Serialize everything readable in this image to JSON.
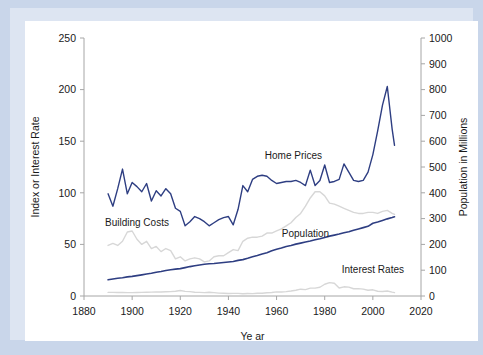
{
  "figure": {
    "background_color": "#c9d6ea",
    "panel_color": "#ffffff",
    "border_color": "#dde5f2"
  },
  "chart_data": {
    "type": "line",
    "title": "",
    "subtitle": "",
    "xlabel": "Ye ar",
    "ylabel": "Index or Interest Rate",
    "y2label": "Population in Millions",
    "xlim": [
      1880,
      2020
    ],
    "ylim": [
      0,
      250
    ],
    "y2lim": [
      0,
      1000
    ],
    "grid": false,
    "legend_position": "inline-annotations",
    "xticks": [
      1880,
      1900,
      1920,
      1940,
      1960,
      1980,
      2000,
      2020
    ],
    "xtick_labels": [
      "1880",
      "1900",
      "1920",
      "1940",
      "1960",
      "1980",
      "2000",
      "2020"
    ],
    "yticks": [
      0,
      50,
      100,
      150,
      200,
      250
    ],
    "ytick_labels": [
      "0",
      "50",
      "100",
      "150",
      "200",
      "250"
    ],
    "y2ticks": [
      0,
      100,
      200,
      300,
      400,
      500,
      600,
      700,
      800,
      900,
      1000
    ],
    "y2tick_labels": [
      "0",
      "100",
      "200",
      "300",
      "400",
      "500",
      "600",
      "700",
      "800",
      "900",
      "1000"
    ],
    "annotations": [
      {
        "text": "Home Prices",
        "x": 1967,
        "y": 133,
        "color": "#2e3e82"
      },
      {
        "text": "Building Costs",
        "x": 1902,
        "y": 68,
        "color": "#1a1a1a"
      },
      {
        "text": "Population",
        "x": 1972,
        "y": 57,
        "color": "#1a1a1a"
      },
      {
        "text": "Interest Rates",
        "x": 2000,
        "y": 22,
        "color": "#1a1a1a"
      }
    ],
    "x": [
      1890,
      1892,
      1894,
      1896,
      1898,
      1900,
      1902,
      1904,
      1906,
      1908,
      1910,
      1912,
      1914,
      1916,
      1918,
      1920,
      1922,
      1924,
      1926,
      1928,
      1930,
      1932,
      1934,
      1936,
      1938,
      1940,
      1942,
      1944,
      1946,
      1948,
      1950,
      1952,
      1954,
      1956,
      1958,
      1960,
      1962,
      1964,
      1966,
      1968,
      1970,
      1972,
      1974,
      1976,
      1978,
      1980,
      1982,
      1984,
      1986,
      1988,
      1990,
      1992,
      1994,
      1996,
      1998,
      2000,
      2002,
      2004,
      2006,
      2008,
      2009
    ],
    "series": [
      {
        "name": "Home Prices",
        "axis": "left",
        "color": "#2e3e82",
        "width": 1.4,
        "values": [
          99,
          87,
          104,
          123,
          99,
          110,
          106,
          101,
          109,
          92,
          102,
          97,
          104,
          99,
          85,
          82,
          68,
          72,
          77,
          75,
          72,
          68,
          71,
          74,
          76,
          77,
          69,
          84,
          107,
          101,
          113,
          116,
          117,
          116,
          112,
          109,
          110,
          111,
          111,
          112,
          110,
          107,
          122,
          107,
          112,
          127,
          110,
          111,
          113,
          128,
          120,
          112,
          111,
          112,
          120,
          137,
          160,
          185,
          203,
          162,
          146
        ]
      },
      {
        "name": "Building Costs",
        "axis": "left",
        "color": "#d7d7d7",
        "width": 1.4,
        "values": [
          49,
          51,
          49,
          53,
          62,
          63,
          55,
          50,
          53,
          46,
          48,
          43,
          46,
          44,
          36,
          38,
          34,
          36,
          37,
          36,
          33,
          34,
          38,
          39,
          39,
          42,
          45,
          44,
          53,
          56,
          57,
          57,
          58,
          61,
          61,
          63,
          65,
          68,
          71,
          76,
          80,
          87,
          95,
          101,
          101,
          97,
          90,
          89,
          87,
          85,
          83,
          81,
          80,
          80,
          81,
          81,
          80,
          82,
          83,
          80,
          79
        ]
      },
      {
        "name": "Population",
        "axis": "right",
        "color": "#2e3e82",
        "width": 1.6,
        "values": [
          63,
          66,
          69,
          71,
          74,
          76,
          79,
          82,
          85,
          88,
          92,
          95,
          99,
          102,
          104,
          106,
          110,
          114,
          117,
          120,
          123,
          125,
          126,
          128,
          130,
          132,
          134,
          138,
          141,
          146,
          152,
          157,
          163,
          168,
          175,
          181,
          186,
          192,
          196,
          201,
          205,
          209,
          213,
          218,
          222,
          227,
          232,
          236,
          240,
          245,
          249,
          255,
          260,
          265,
          270,
          282,
          287,
          293,
          299,
          304,
          307
        ]
      },
      {
        "name": "Interest Rates",
        "axis": "left",
        "color": "#d7d7d7",
        "width": 1.4,
        "values": [
          3.5,
          3.5,
          3.4,
          3.4,
          3.3,
          3.3,
          3.4,
          3.5,
          3.6,
          3.8,
          3.9,
          3.9,
          4.1,
          4.2,
          4.6,
          5.3,
          4.5,
          4.2,
          3.7,
          3.5,
          3.3,
          3.7,
          3.3,
          2.8,
          2.6,
          2.4,
          2.5,
          2.5,
          2.2,
          2.4,
          2.3,
          2.7,
          2.6,
          3.1,
          3.4,
          4.0,
          3.9,
          4.2,
          4.8,
          5.6,
          6.6,
          6.2,
          7.6,
          7.6,
          8.5,
          11.4,
          13.0,
          12.4,
          7.7,
          8.9,
          8.6,
          7.0,
          7.1,
          6.7,
          5.6,
          6.0,
          4.6,
          4.3,
          4.8,
          3.7,
          3.3
        ]
      }
    ]
  }
}
